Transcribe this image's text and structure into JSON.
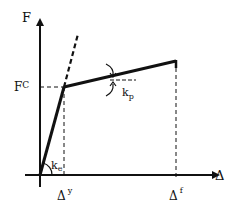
{
  "diagram": {
    "type": "bilinear force-displacement curve",
    "axes": {
      "y_label": "F",
      "x_label": "Δ"
    },
    "labels": {
      "force_yield": "F",
      "force_yield_sup": "C",
      "disp_yield": "Δ",
      "disp_yield_sup": "y",
      "disp_final": "Δ",
      "disp_final_sup": "f",
      "elastic_stiffness": "k",
      "elastic_stiffness_sub": "e",
      "plastic_stiffness": "k",
      "plastic_stiffness_sub": "p"
    },
    "colors": {
      "line": "#111111",
      "background": "#ffffff"
    }
  }
}
